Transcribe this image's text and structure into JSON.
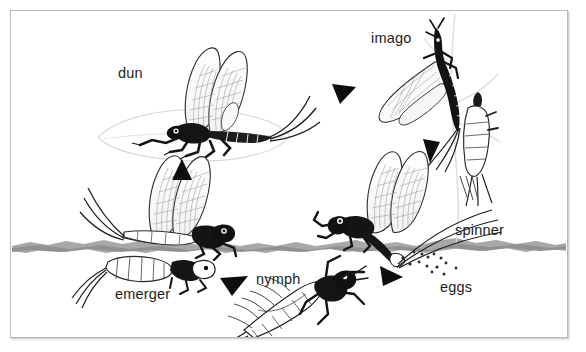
{
  "diagram": {
    "background_color": "#ffffff",
    "frame_color": "#b9b9b9",
    "ink_color": "#1d1d1d",
    "water_color": "#8c8c8c",
    "labels": [
      {
        "id": "dun",
        "text": "dun"
      },
      {
        "id": "imago",
        "text": "imago"
      },
      {
        "id": "emerger",
        "text": "emerger"
      },
      {
        "id": "nymph",
        "text": "nymph"
      },
      {
        "id": "spinner",
        "text": "spinner"
      },
      {
        "id": "eggs",
        "text": "eggs"
      }
    ],
    "arrows": [
      {
        "id": "nymph-to-emerger",
        "direction": "up"
      },
      {
        "id": "dun-to-imago",
        "direction": "down-right"
      },
      {
        "id": "imago-to-spinner",
        "direction": "down"
      },
      {
        "id": "spinner-to-eggs",
        "direction": "right"
      },
      {
        "id": "eggs-to-nymph",
        "direction": "down-left"
      }
    ]
  }
}
